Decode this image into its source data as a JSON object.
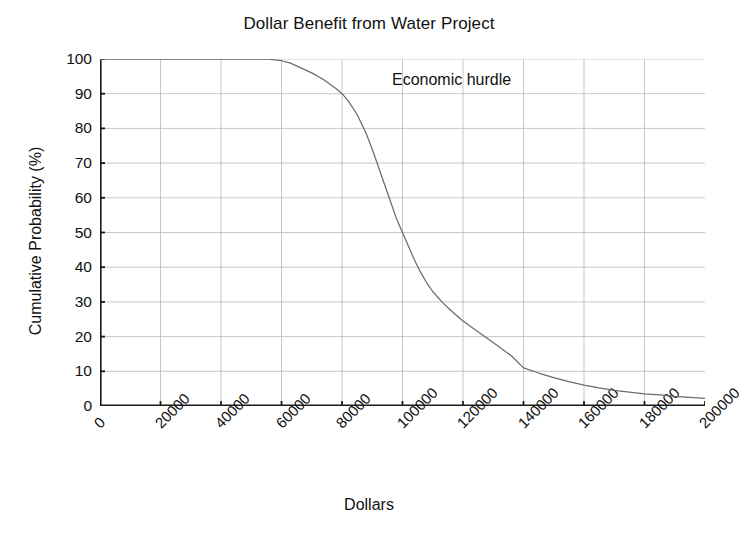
{
  "chart_data": {
    "type": "line",
    "title": "Dollar Benefit from Water Project",
    "xlabel": "Dollars",
    "ylabel": "Cumulative Probability (%)",
    "xlim": [
      0,
      200000
    ],
    "ylim": [
      0,
      100
    ],
    "grid": true,
    "legend": null,
    "xticks": [
      0,
      20000,
      40000,
      60000,
      80000,
      100000,
      120000,
      140000,
      160000,
      180000,
      200000
    ],
    "xtick_labels": [
      "0",
      "20000",
      "40000",
      "60000",
      "80000",
      "100000",
      "120000",
      "140000",
      "160000",
      "180000",
      "200000"
    ],
    "yticks": [
      0,
      10,
      20,
      30,
      40,
      50,
      60,
      70,
      80,
      90,
      100
    ],
    "ytick_labels": [
      "0",
      "10",
      "20",
      "30",
      "40",
      "50",
      "60",
      "70",
      "80",
      "90",
      "100"
    ],
    "annotations": [
      {
        "text": "Economic hurdle",
        "x": 118000,
        "y": 93
      }
    ],
    "series": [
      {
        "name": "Cumulative Probability",
        "x": [
          0,
          10000,
          20000,
          30000,
          40000,
          50000,
          55000,
          60000,
          63000,
          66000,
          70000,
          74000,
          78000,
          80000,
          82000,
          85000,
          88000,
          90000,
          92000,
          94000,
          96000,
          98000,
          100000,
          102000,
          104000,
          106000,
          108000,
          110000,
          113000,
          116000,
          120000,
          124000,
          128000,
          132000,
          136000,
          140000,
          145000,
          150000,
          155000,
          160000,
          165000,
          170000,
          175000,
          180000,
          185000,
          190000,
          195000,
          200000
        ],
        "y": [
          100,
          100,
          100,
          100,
          100,
          100,
          100,
          99.5,
          98.8,
          97.6,
          96.0,
          94.0,
          91.5,
          90.0,
          88.0,
          84.0,
          78.5,
          74.0,
          69.0,
          64.0,
          59.0,
          54.0,
          50.0,
          46.0,
          42.0,
          38.5,
          35.5,
          33.0,
          30.0,
          27.5,
          24.5,
          22.0,
          19.5,
          17.0,
          14.5,
          11.0,
          9.5,
          8.2,
          7.0,
          6.0,
          5.2,
          4.5,
          4.0,
          3.5,
          3.2,
          2.8,
          2.5,
          2.2
        ]
      }
    ],
    "colors": {
      "line": "#6b6b6b",
      "axis": "#1a1a1a",
      "grid": "#b9b9b9",
      "background": "#ffffff",
      "text": "#111111"
    }
  }
}
